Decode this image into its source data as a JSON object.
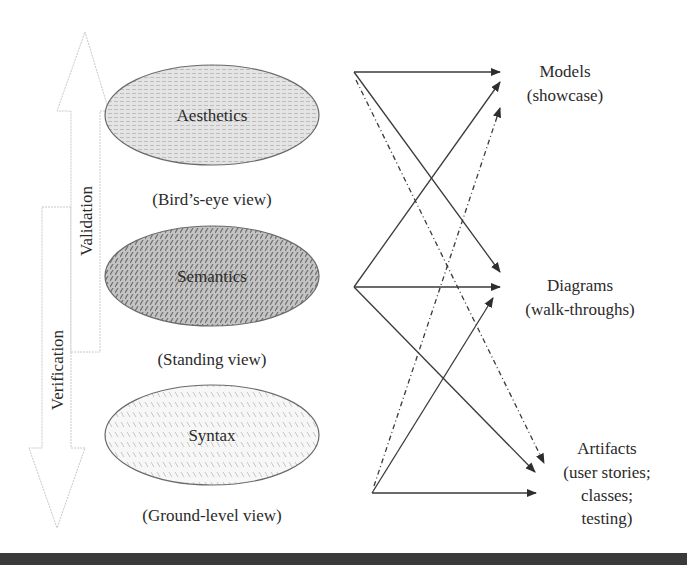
{
  "left_arrows": {
    "validation": {
      "label": "Validation",
      "direction": "up"
    },
    "verification": {
      "label": "Verification",
      "direction": "down"
    }
  },
  "levels": [
    {
      "label": "Aesthetics",
      "caption": "(Bird’s-eye view)",
      "fill": "#d9d9d9",
      "pattern": "dotted-text"
    },
    {
      "label": "Semantics",
      "caption": "(Standing view)",
      "fill": "#b0b0b0",
      "pattern": "dense-diagonal"
    },
    {
      "label": "Syntax",
      "caption": "(Ground-level view)",
      "fill": "#f2f2f2",
      "pattern": "light-diagonal"
    }
  ],
  "targets": [
    {
      "lines": [
        "Models",
        "(showcase)"
      ]
    },
    {
      "lines": [
        "Diagrams",
        "(walk-throughs)"
      ]
    },
    {
      "lines": [
        "Artifacts",
        "(user stories;",
        "classes;",
        "testing)"
      ]
    }
  ],
  "connections": [
    {
      "from": "top",
      "to": "Models",
      "style": "solid"
    },
    {
      "from": "top",
      "to": "Diagrams",
      "style": "solid"
    },
    {
      "from": "top",
      "to": "Artifacts",
      "style": "dashed"
    },
    {
      "from": "middle",
      "to": "Models",
      "style": "solid"
    },
    {
      "from": "middle",
      "to": "Diagrams",
      "style": "solid"
    },
    {
      "from": "middle",
      "to": "Artifacts",
      "style": "solid"
    },
    {
      "from": "bottom",
      "to": "Models",
      "style": "dashed"
    },
    {
      "from": "bottom",
      "to": "Diagrams",
      "style": "solid"
    },
    {
      "from": "bottom",
      "to": "Artifacts",
      "style": "solid"
    }
  ],
  "colors": {
    "line": "#3a3a3a",
    "arrow_outline": "#c8c8c8",
    "bottom_bar": "#3a3a3a"
  }
}
